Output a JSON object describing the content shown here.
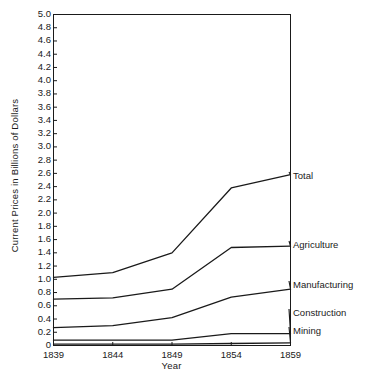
{
  "chart_data": {
    "type": "line",
    "title": "",
    "xlabel": "Year",
    "ylabel": "Current Prices in Billions of Dollars",
    "x": [
      1839,
      1844,
      1849,
      1854,
      1859
    ],
    "categories": [
      "1839",
      "1844",
      "1849",
      "1854",
      "1859"
    ],
    "xlim": [
      1839,
      1859
    ],
    "ylim": [
      0,
      5.0
    ],
    "ytick_labels": [
      "5.0",
      "4.8",
      "4.6",
      "4.4",
      "4.2",
      "4.0",
      "3.8",
      "3.6",
      "3.4",
      "3.2",
      "3.0",
      "2.8",
      "2.6",
      "2.4",
      "2.2",
      "2.0",
      "1.8",
      "1.6",
      "1.4",
      "1.2",
      "1.0",
      "0.8",
      "0.6",
      "0.4",
      "0.2",
      "0"
    ],
    "ytick_values": [
      5.0,
      4.8,
      4.6,
      4.4,
      4.2,
      4.0,
      3.8,
      3.6,
      3.4,
      3.2,
      3.0,
      2.8,
      2.6,
      2.4,
      2.2,
      2.0,
      1.8,
      1.6,
      1.4,
      1.2,
      1.0,
      0.8,
      0.6,
      0.4,
      0.2,
      0
    ],
    "grid": false,
    "legend_position": "right-inline-labels",
    "series": [
      {
        "name": "Total",
        "values": [
          1.03,
          1.1,
          1.4,
          2.38,
          2.58
        ]
      },
      {
        "name": "Agriculture",
        "values": [
          0.7,
          0.72,
          0.85,
          1.48,
          1.5
        ]
      },
      {
        "name": "Manufacturing",
        "values": [
          0.27,
          0.3,
          0.42,
          0.73,
          0.85
        ]
      },
      {
        "name": "Construction",
        "values": [
          0.08,
          0.08,
          0.08,
          0.18,
          0.18
        ]
      },
      {
        "name": "Mining",
        "values": [
          0.02,
          0.02,
          0.02,
          0.03,
          0.04
        ]
      }
    ],
    "series_label_positions": [
      {
        "name": "Total",
        "x": 293,
        "y": 176
      },
      {
        "name": "Agriculture",
        "x": 293,
        "y": 245
      },
      {
        "name": "Manufacturing",
        "x": 293,
        "y": 285
      },
      {
        "name": "Construction",
        "x": 293,
        "y": 313
      },
      {
        "name": "Mining",
        "x": 293,
        "y": 331
      }
    ],
    "line_color": "#1a1a1a",
    "axis_color": "#1a1a1a",
    "background": "#ffffff"
  }
}
